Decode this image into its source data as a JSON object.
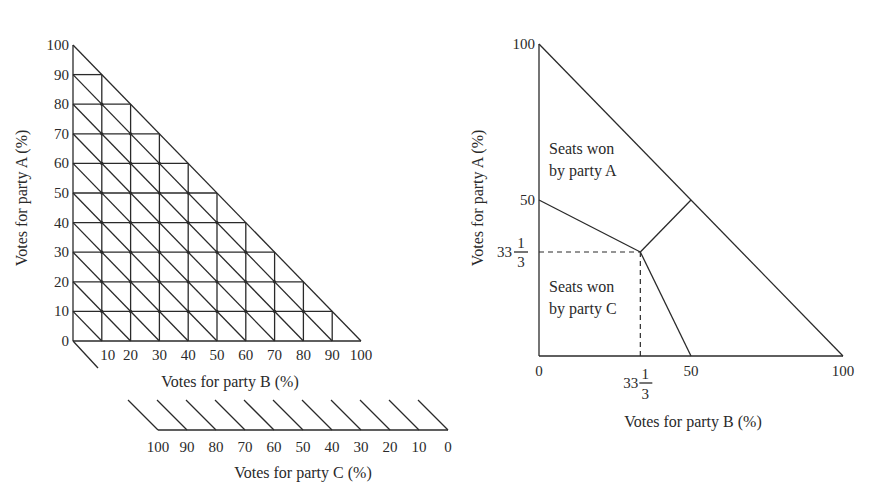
{
  "left_chart": {
    "y_axis_label": "Votes for party A (%)",
    "x_axis_label": "Votes for party B (%)",
    "c_axis_label": "Votes for party C (%)",
    "y_ticks": [
      "0",
      "10",
      "20",
      "30",
      "40",
      "50",
      "60",
      "70",
      "80",
      "90",
      "100"
    ],
    "x_ticks": [
      "10",
      "20",
      "30",
      "40",
      "50",
      "60",
      "70",
      "80",
      "90",
      "100"
    ],
    "c_ticks": [
      "100",
      "90",
      "80",
      "70",
      "60",
      "50",
      "40",
      "30",
      "20",
      "10",
      "0"
    ],
    "grid_step": 10
  },
  "right_chart": {
    "y_axis_label": "Votes for party A (%)",
    "x_axis_label": "Votes for party B (%)",
    "y_ticks": [
      {
        "value": 100,
        "label": "100"
      },
      {
        "value": 50,
        "label": "50"
      },
      {
        "value": 33.333,
        "label_whole": "33",
        "label_num": "1",
        "label_den": "3"
      }
    ],
    "x_ticks": [
      {
        "value": 0,
        "label": "0"
      },
      {
        "value": 33.333,
        "label_whole": "33",
        "label_num": "1",
        "label_den": "3"
      },
      {
        "value": 50,
        "label": "50"
      },
      {
        "value": 100,
        "label": "100"
      }
    ],
    "regions": [
      {
        "line1": "Seats won",
        "line2": "by party A"
      },
      {
        "line1": "Seats won",
        "line2": "by party C"
      }
    ],
    "boundaries": [
      {
        "from": [
          0,
          50
        ],
        "to": [
          33.333,
          33.333
        ]
      },
      {
        "from": [
          33.333,
          33.333
        ],
        "to": [
          50,
          50
        ]
      },
      {
        "from": [
          33.333,
          33.333
        ],
        "to": [
          50,
          0
        ]
      }
    ],
    "center_point": [
      33.333,
      33.333
    ]
  },
  "chart_data": [
    {
      "type": "ternary-grid",
      "title": "",
      "xlabel": "Votes for party B (%)",
      "ylabel": "Votes for party A (%)",
      "clabel": "Votes for party C (%)",
      "xlim": [
        0,
        100
      ],
      "ylim": [
        0,
        100
      ],
      "grid": true,
      "grid_step": 10,
      "constraint": "A + B + C = 100"
    },
    {
      "type": "region-diagram",
      "title": "",
      "xlabel": "Votes for party B (%)",
      "ylabel": "Votes for party A (%)",
      "xlim": [
        0,
        100
      ],
      "ylim": [
        0,
        100
      ],
      "regions": [
        "Seats won by party A",
        "Seats won by party C"
      ],
      "boundary_segments": [
        [
          [
            0,
            50
          ],
          [
            33.333,
            33.333
          ]
        ],
        [
          [
            33.333,
            33.333
          ],
          [
            50,
            50
          ]
        ],
        [
          [
            33.333,
            33.333
          ],
          [
            50,
            0
          ]
        ]
      ],
      "reference_lines": [
        {
          "type": "dashed",
          "x": 33.333,
          "y_range": [
            0,
            33.333
          ]
        },
        {
          "type": "dashed",
          "y": 33.333,
          "x_range": [
            0,
            33.333
          ]
        }
      ]
    }
  ]
}
